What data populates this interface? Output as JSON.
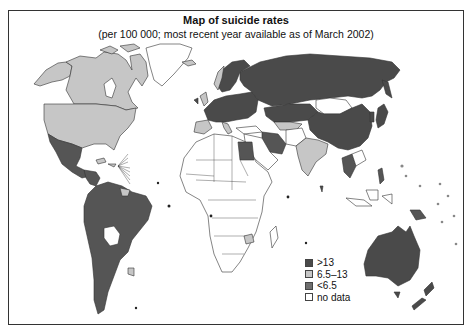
{
  "title": "Map of suicide rates",
  "subtitle": "(per 100 000; most recent year available as of March 2002)",
  "colors": {
    "high": "#4a4a4a",
    "mid": "#c6c6c6",
    "low": "#7a7a7a",
    "nodata": "#ffffff",
    "border": "#333333"
  },
  "legend": [
    {
      "label": ">13",
      "category": "high",
      "color": "#4a4a4a"
    },
    {
      "label": "6.5–13",
      "category": "mid",
      "color": "#c6c6c6"
    },
    {
      "label": "<6.5",
      "category": "low",
      "color": "#6e6e6e"
    },
    {
      "label": "no data",
      "category": "nodata",
      "color": "#ffffff"
    }
  ],
  "regions": [
    {
      "name": "Canada",
      "category": "mid"
    },
    {
      "name": "United States",
      "category": "mid"
    },
    {
      "name": "Alaska",
      "category": "mid"
    },
    {
      "name": "Greenland",
      "category": "nodata"
    },
    {
      "name": "Mexico",
      "category": "low"
    },
    {
      "name": "Central America",
      "category": "low"
    },
    {
      "name": "South America",
      "category": "low"
    },
    {
      "name": "Bolivia",
      "category": "nodata"
    },
    {
      "name": "Uruguay",
      "category": "mid"
    },
    {
      "name": "Guyana/Suriname",
      "category": "mid"
    },
    {
      "name": "Europe",
      "category": "high"
    },
    {
      "name": "Russia",
      "category": "high"
    },
    {
      "name": "Kazakhstan",
      "category": "high"
    },
    {
      "name": "China",
      "category": "high"
    },
    {
      "name": "Mongolia",
      "category": "nodata"
    },
    {
      "name": "Japan",
      "category": "high"
    },
    {
      "name": "India",
      "category": "mid"
    },
    {
      "name": "Iran",
      "category": "low"
    },
    {
      "name": "Egypt",
      "category": "low"
    },
    {
      "name": "Africa",
      "category": "nodata"
    },
    {
      "name": "Zimbabwe",
      "category": "mid"
    },
    {
      "name": "Thailand",
      "category": "low"
    },
    {
      "name": "Philippines",
      "category": "low"
    },
    {
      "name": "Australia",
      "category": "high"
    },
    {
      "name": "New Zealand",
      "category": "high"
    },
    {
      "name": "Papua New Guinea",
      "category": "low"
    }
  ]
}
